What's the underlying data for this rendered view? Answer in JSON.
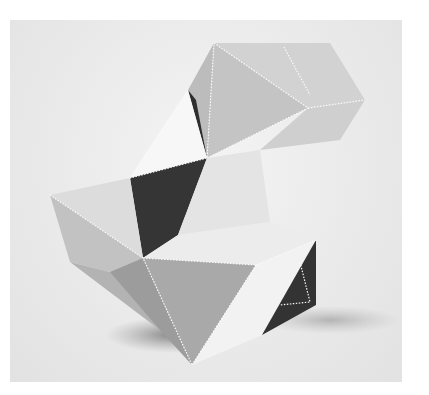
{
  "image": {
    "subject": "geometric folded polyhedral sculpture",
    "style": "grayscale photograph",
    "background_color": "#ececec",
    "shades": {
      "lightest": "#f3f3f3",
      "light": "#dcdcdc",
      "mid": "#bdbdbd",
      "midDark": "#9a9a9a",
      "dark": "#3a3a3a",
      "shadow": "#8e8e8e"
    }
  }
}
